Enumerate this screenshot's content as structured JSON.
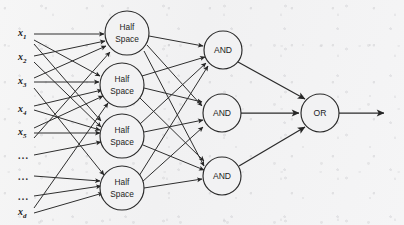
{
  "figure": {
    "background_color": "#f3f3f3",
    "ink_color": "#2a2a2a"
  },
  "inputs": {
    "items": [
      {
        "id": "x1",
        "text": "x",
        "sub": "1",
        "kind": "variable",
        "y": 34
      },
      {
        "id": "x2",
        "text": "x",
        "sub": "2",
        "kind": "variable",
        "y": 58
      },
      {
        "id": "x3",
        "text": "x",
        "sub": "3",
        "kind": "variable",
        "y": 82
      },
      {
        "id": "x4",
        "text": "x",
        "sub": "4",
        "kind": "variable",
        "y": 110
      },
      {
        "id": "x5",
        "text": "x",
        "sub": "5",
        "kind": "variable",
        "y": 133
      },
      {
        "id": "dots1",
        "text": "...",
        "sub": "",
        "kind": "ellipsis",
        "y": 155
      },
      {
        "id": "dots2",
        "text": "...",
        "sub": "",
        "kind": "ellipsis",
        "y": 176
      },
      {
        "id": "dots3",
        "text": "...",
        "sub": "",
        "kind": "ellipsis",
        "y": 196
      },
      {
        "id": "xd",
        "text": "x",
        "sub": "d",
        "kind": "variable",
        "y": 213
      }
    ],
    "label_x": 18
  },
  "layers": {
    "hidden_layer_1": {
      "name": "half-space-layer",
      "node_label_line1": "Half",
      "node_label_line2": "Space",
      "radius": 22,
      "nodes": [
        {
          "id": "hs1",
          "cx": 127,
          "cy": 33
        },
        {
          "id": "hs2",
          "cx": 122,
          "cy": 85
        },
        {
          "id": "hs3",
          "cx": 122,
          "cy": 136
        },
        {
          "id": "hs4",
          "cx": 122,
          "cy": 188
        }
      ]
    },
    "hidden_layer_2": {
      "name": "and-layer",
      "node_label": "AND",
      "radius": 19,
      "nodes": [
        {
          "id": "and1",
          "cx": 223,
          "cy": 50
        },
        {
          "id": "and2",
          "cx": 222,
          "cy": 113
        },
        {
          "id": "and3",
          "cx": 222,
          "cy": 176
        }
      ]
    },
    "output_layer": {
      "name": "or-layer",
      "node_label": "OR",
      "radius": 19,
      "nodes": [
        {
          "id": "or1",
          "cx": 320,
          "cy": 113
        }
      ],
      "output_arrow_end_x": 386
    }
  },
  "edges": {
    "input_to_halfspace": [
      {
        "from": "x1",
        "to": "hs1"
      },
      {
        "from": "x1",
        "to": "hs2"
      },
      {
        "from": "x2",
        "to": "hs1"
      },
      {
        "from": "x2",
        "to": "hs3"
      },
      {
        "from": "x3",
        "to": "hs2"
      },
      {
        "from": "x3",
        "to": "hs1"
      },
      {
        "from": "x4",
        "to": "hs3"
      },
      {
        "from": "x4",
        "to": "hs2"
      },
      {
        "from": "x5",
        "to": "hs3"
      },
      {
        "from": "x5",
        "to": "hs1"
      },
      {
        "from": "xd",
        "to": "hs4"
      },
      {
        "from": "xd",
        "to": "hs2"
      },
      {
        "from": "dots2",
        "to": "hs4"
      },
      {
        "from": "dots1",
        "to": "hs3"
      }
    ],
    "halfspace_to_and": "fully-connected",
    "and_to_or": [
      {
        "from": "and1",
        "to": "or1"
      },
      {
        "from": "and2",
        "to": "or1"
      },
      {
        "from": "and3",
        "to": "or1"
      }
    ]
  }
}
